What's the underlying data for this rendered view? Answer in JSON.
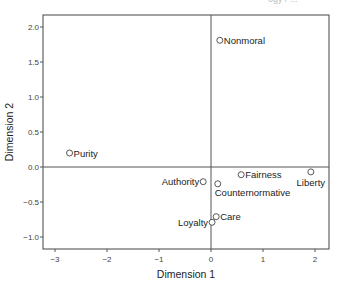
{
  "header_fragment": "ogy / ...",
  "chart_data": {
    "type": "scatter",
    "title": "",
    "xlabel": "Dimension 1",
    "ylabel": "Dimension 2",
    "xlim": [
      -3.3,
      2.3
    ],
    "ylim": [
      -1.15,
      2.15
    ],
    "xticks": [
      -3,
      -2,
      -1,
      0,
      1,
      2
    ],
    "yticks": [
      -1.0,
      -0.5,
      0.0,
      0.5,
      1.0,
      1.5,
      2.0
    ],
    "xtick_labels": [
      "−3",
      "−2",
      "−1",
      "0",
      "1",
      "2"
    ],
    "ytick_labels": [
      "−1.0",
      "−0.5",
      "0.0",
      "0.5",
      "1.0",
      "1.5",
      "2.0"
    ],
    "reference_lines": {
      "x": 0,
      "y": 0
    },
    "grid": false,
    "legend": null,
    "marker": "open-circle",
    "points": [
      {
        "label": "Nonmoral",
        "x": 0.17,
        "y": 1.81,
        "label_pos": "right"
      },
      {
        "label": "Purity",
        "x": -2.72,
        "y": 0.2,
        "label_pos": "right"
      },
      {
        "label": "Authority",
        "x": -0.15,
        "y": -0.21,
        "label_pos": "left"
      },
      {
        "label": "Counternormative",
        "x": 0.13,
        "y": -0.24,
        "label_pos": "below-right"
      },
      {
        "label": "Fairness",
        "x": 0.58,
        "y": -0.11,
        "label_pos": "right"
      },
      {
        "label": "Liberty",
        "x": 1.92,
        "y": -0.07,
        "label_pos": "below"
      },
      {
        "label": "Care",
        "x": 0.1,
        "y": -0.71,
        "label_pos": "right"
      },
      {
        "label": "Loyalty",
        "x": 0.02,
        "y": -0.79,
        "label_pos": "left"
      }
    ]
  }
}
